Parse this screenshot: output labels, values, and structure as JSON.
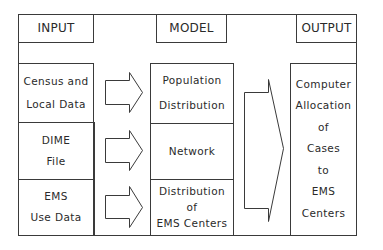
{
  "headers": {
    "input": "INPUT",
    "model": "MODEL",
    "output": "OUTPUT"
  },
  "inputs": [
    {
      "line1": "Census and",
      "line2": "Local Data"
    },
    {
      "line1": "DIME",
      "line2": "File"
    },
    {
      "line1": "EMS",
      "line2": "Use Data"
    }
  ],
  "models": [
    {
      "line1": "Population",
      "line2": "Distribution",
      "line3": ""
    },
    {
      "line1": "Network",
      "line2": "",
      "line3": ""
    },
    {
      "line1": "Distribution",
      "line2": "of",
      "line3": "EMS Centers"
    }
  ],
  "output": {
    "lines": [
      "Computer",
      "Allocation",
      "of",
      "Cases",
      "to",
      "EMS",
      "Centers"
    ]
  },
  "colors": {
    "line": "#3a3a3a",
    "background": "#ffffff"
  }
}
